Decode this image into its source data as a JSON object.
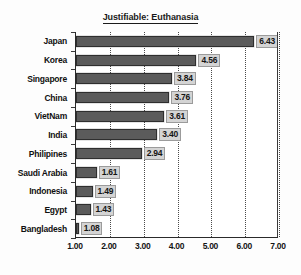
{
  "chart_data": {
    "type": "bar",
    "orientation": "horizontal",
    "title": "Justifiable: Euthanasia",
    "xlabel": "",
    "ylabel": "",
    "xlim": [
      1.0,
      7.0
    ],
    "xticks": [
      "1.00",
      "2.00",
      "3.00",
      "4.00",
      "5.00",
      "6.00",
      "7.00"
    ],
    "xtick_values": [
      1,
      2,
      3,
      4,
      5,
      6,
      7
    ],
    "grid": "vertical-dotted",
    "legend": "none",
    "bar_baseline": 1.0,
    "categories": [
      "Japan",
      "Korea",
      "Singapore",
      "China",
      "VietNam",
      "India",
      "Philipines",
      "Saudi Arabia",
      "Indonesia",
      "Egypt",
      "Bangladesh"
    ],
    "values": [
      6.43,
      4.56,
      3.84,
      3.76,
      3.61,
      3.4,
      2.94,
      1.61,
      1.49,
      1.43,
      1.08
    ],
    "value_labels": [
      "6.43",
      "4.56",
      "3.84",
      "3.76",
      "3.61",
      "3.40",
      "2.94",
      "1.61",
      "1.49",
      "1.43",
      "1.08"
    ],
    "colors": {
      "bar_fill": "#5b5b5b",
      "bar_border": "#2e2e2e",
      "label_box_fill": "#d4d4d4",
      "label_box_border": "#9b9b9b",
      "axis": "#2a2a2a",
      "gridline": "#4a4a4a",
      "text": "#141414",
      "background": "#ffffff"
    }
  }
}
